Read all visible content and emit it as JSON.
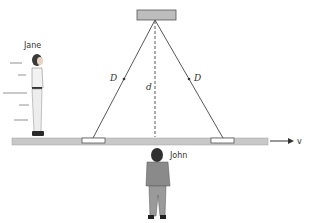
{
  "diagram": {
    "type": "light-clock relativity diagram",
    "labels": {
      "observer_left": "Jane",
      "observer_bottom": "John",
      "path_left": "D",
      "path_right": "D",
      "height": "d",
      "velocity": "v"
    },
    "colors": {
      "platform": "#c8c8c8",
      "mirror_top": "#bdbdbd",
      "line": "#444444",
      "background": "#ffffff"
    }
  }
}
